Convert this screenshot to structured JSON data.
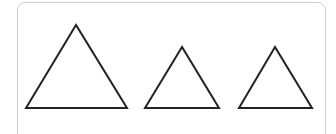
{
  "figure": {
    "stroke_color": "#222222",
    "panel_border_color": "#cfcfcf",
    "triangles": [
      {
        "name": "large-triangle",
        "points": "76,25 26,108 127,108"
      },
      {
        "name": "medium-triangle",
        "points": "182,47 145,108 219,108"
      },
      {
        "name": "small-triangle",
        "points": "275,47 239,108 312,108"
      }
    ]
  }
}
